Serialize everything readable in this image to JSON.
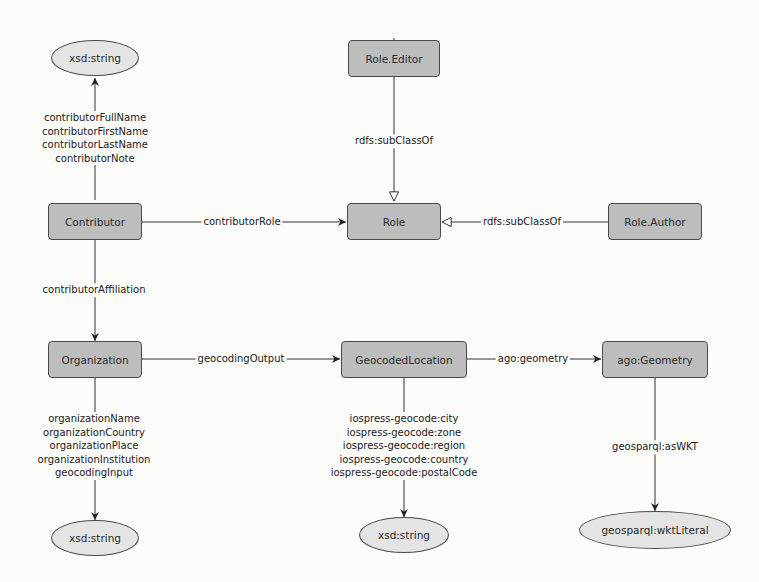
{
  "diagram": {
    "colors": {
      "class_fill": "#bdbdbd",
      "literal_fill": "#e4e4e4",
      "stroke": "#4a4a4a",
      "text": "#2a2a2a",
      "background": "#fbfbfa"
    },
    "nodes": {
      "xsd_string_top": {
        "label": "xsd:string",
        "shape": "ellipse"
      },
      "role_editor": {
        "label": "Role.Editor",
        "shape": "rounded-rect"
      },
      "contributor": {
        "label": "Contributor",
        "shape": "rounded-rect"
      },
      "role": {
        "label": "Role",
        "shape": "rounded-rect"
      },
      "role_author": {
        "label": "Role.Author",
        "shape": "rounded-rect"
      },
      "organization": {
        "label": "Organization",
        "shape": "rounded-rect"
      },
      "geocoded_location": {
        "label": "GeocodedLocation",
        "shape": "rounded-rect"
      },
      "ago_geometry": {
        "label": "ago:Geometry",
        "shape": "rounded-rect"
      },
      "xsd_string_left": {
        "label": "xsd:string",
        "shape": "ellipse"
      },
      "xsd_string_mid": {
        "label": "xsd:string",
        "shape": "ellipse"
      },
      "wkt_literal": {
        "label": "geosparql:wktLiteral",
        "shape": "ellipse"
      }
    },
    "edges": {
      "contributor_props": {
        "from": "Contributor",
        "to": "xsd:string",
        "labels": [
          "contributorFullName",
          "contributorFirstName",
          "contributorLastName",
          "contributorNote"
        ]
      },
      "editor_subclass": {
        "from": "Role.Editor",
        "to": "Role",
        "labels": [
          "rdfs:subClassOf"
        ],
        "arrow": "hollow"
      },
      "contributor_role": {
        "from": "Contributor",
        "to": "Role",
        "labels": [
          "contributorRole"
        ],
        "arrow": "filled"
      },
      "author_subclass": {
        "from": "Role.Author",
        "to": "Role",
        "labels": [
          "rdfs:subClassOf"
        ],
        "arrow": "hollow"
      },
      "contributor_affiliation": {
        "from": "Contributor",
        "to": "Organization",
        "labels": [
          "contributorAffiliation"
        ],
        "arrow": "filled"
      },
      "geocoding_output": {
        "from": "Organization",
        "to": "GeocodedLocation",
        "labels": [
          "geocodingOutput"
        ],
        "arrow": "filled"
      },
      "ago_geometry_edge": {
        "from": "GeocodedLocation",
        "to": "ago:Geometry",
        "labels": [
          "ago:geometry"
        ],
        "arrow": "filled"
      },
      "organization_props": {
        "from": "Organization",
        "to": "xsd:string",
        "labels": [
          "organizationName",
          "organizationCountry",
          "organizationPlace",
          "organizationInstitution",
          "geocodingInput"
        ]
      },
      "location_props": {
        "from": "GeocodedLocation",
        "to": "xsd:string",
        "labels": [
          "iospress-geocode:city",
          "iospress-geocode:zone",
          "iospress-geocode:region",
          "iospress-geocode:country",
          "iospress-geocode:postalCode"
        ]
      },
      "as_wkt": {
        "from": "ago:Geometry",
        "to": "geosparql:wktLiteral",
        "labels": [
          "geosparql:asWKT"
        ],
        "arrow": "filled"
      }
    }
  }
}
